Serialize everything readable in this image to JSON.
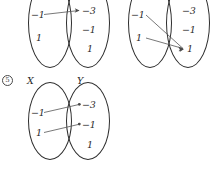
{
  "page": {
    "item_number": "5",
    "width": 220,
    "height": 169,
    "ink_color": "#2e2e2e",
    "arrow_color": "#555555"
  },
  "diagrams": [
    {
      "id": "top-left",
      "domain_label": "",
      "codomain_label": "",
      "domain_elements": [
        "−1",
        "1"
      ],
      "codomain_elements": [
        "−3",
        "−1",
        "1"
      ],
      "arrows": [
        {
          "from": "−1",
          "to": "−3"
        }
      ]
    },
    {
      "id": "top-right",
      "domain_label": "",
      "codomain_label": "",
      "domain_elements": [
        "−1",
        "1"
      ],
      "codomain_elements": [
        "−3",
        "−1",
        "1"
      ],
      "arrows": [
        {
          "from": "−1",
          "to": "1"
        },
        {
          "from": "1",
          "to": "1"
        }
      ]
    },
    {
      "id": "bottom-left",
      "domain_label": "X",
      "codomain_label": "Y",
      "domain_elements": [
        "−1",
        "1"
      ],
      "codomain_elements": [
        "−3",
        "−1",
        "1"
      ],
      "arrows": [
        {
          "from": "−1",
          "to": "−3"
        },
        {
          "from": "1",
          "to": "−1"
        }
      ]
    }
  ]
}
